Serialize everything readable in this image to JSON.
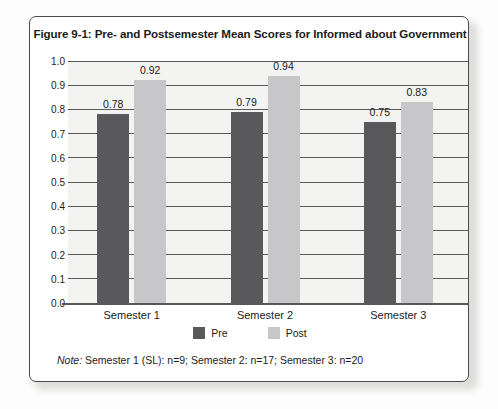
{
  "card": {
    "title": "Figure 9-1:  Pre- and Postsemester Mean Scores for Informed about Government",
    "note_label": "Note:",
    "note_text": " Semester 1 (SL): n=9; Semester 2: n=17; Semester 3: n=20"
  },
  "legend": {
    "items": [
      {
        "label": "Pre",
        "color": "#59595b"
      },
      {
        "label": "Post",
        "color": "#c7c7c9"
      }
    ]
  },
  "chart_data": {
    "type": "bar",
    "title": "Figure 9-1:  Pre- and Postsemester Mean Scores for Informed about Government",
    "xlabel": "",
    "ylabel": "",
    "ylim": [
      0.0,
      1.0
    ],
    "ytick_step": 0.1,
    "yticks": [
      "1.0",
      "0.9",
      "0.8",
      "0.7",
      "0.6",
      "0.5",
      "0.4",
      "0.3",
      "0.2",
      "0.1",
      "0.0"
    ],
    "grid": true,
    "grid_axis": "y",
    "legend_position": "bottom-center",
    "categories": [
      "Semester 1",
      "Semester 2",
      "Semester 3"
    ],
    "series": [
      {
        "name": "Pre",
        "color": "#59595b",
        "values": [
          0.78,
          0.79,
          0.75
        ],
        "labels": [
          "0.78",
          "0.79",
          "0.75"
        ]
      },
      {
        "name": "Post",
        "color": "#c7c7c9",
        "values": [
          0.92,
          0.94,
          0.83
        ],
        "labels": [
          "0.92",
          "0.94",
          "0.83"
        ]
      }
    ],
    "note": "Note: Semester 1 (SL): n=9; Semester 2: n=17; Semester 3: n=20"
  }
}
